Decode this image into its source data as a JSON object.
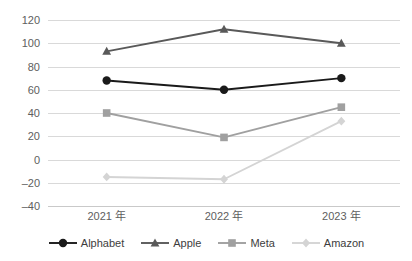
{
  "chart_data": {
    "type": "line",
    "title": "",
    "xlabel": "",
    "ylabel": "",
    "categories": [
      "2021 年",
      "2022 年",
      "2023 年"
    ],
    "ylim": [
      -40,
      120
    ],
    "ytick_step": 20,
    "yticks": [
      "120",
      "100",
      "80",
      "60",
      "40",
      "20",
      "0",
      "–20",
      "–40"
    ],
    "ytick_values": [
      120,
      100,
      80,
      60,
      40,
      20,
      0,
      -20,
      -40
    ],
    "grid": true,
    "legend_position": "bottom",
    "series": [
      {
        "name": "Alphabet",
        "values": [
          68,
          60,
          70
        ],
        "color": "#1a1a1a",
        "marker": "circle"
      },
      {
        "name": "Apple",
        "values": [
          93,
          112,
          100
        ],
        "color": "#595959",
        "marker": "triangle"
      },
      {
        "name": "Meta",
        "values": [
          40,
          19,
          45
        ],
        "color": "#a0a0a0",
        "marker": "square"
      },
      {
        "name": "Amazon",
        "values": [
          -15,
          -17,
          33
        ],
        "color": "#d4d4d4",
        "marker": "diamond"
      }
    ]
  },
  "legend": {
    "items": [
      {
        "label": "Alphabet"
      },
      {
        "label": "Apple"
      },
      {
        "label": "Meta"
      },
      {
        "label": "Amazon"
      }
    ]
  }
}
